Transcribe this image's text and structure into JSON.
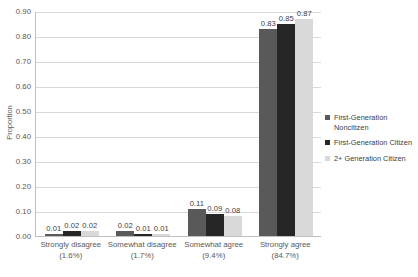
{
  "chart_data": {
    "type": "bar",
    "title": "",
    "subtitle": "",
    "xlabel": "",
    "ylabel": "Proportion",
    "ylim": [
      0.0,
      0.9
    ],
    "ytick_labels": [
      "0.90",
      "0.80",
      "0.70",
      "0.60",
      "0.50",
      "0.40",
      "0.30",
      "0.20",
      "0.10",
      "0.00"
    ],
    "ytick_values": [
      0.9,
      0.8,
      0.7,
      0.6,
      0.5,
      0.4,
      0.3,
      0.2,
      0.1,
      0.0
    ],
    "grid": true,
    "legend_position": "right",
    "categories": [
      "Strongly disagree",
      "Somewhat disagree",
      "Somewhat agree",
      "Strongly agree"
    ],
    "category_percents": [
      "(1.6%)",
      "(1.7%)",
      "(9.4%)",
      "(84.7%)"
    ],
    "series": [
      {
        "name": "First-Generation Noncitizen",
        "color": "#595959",
        "values": [
          0.01,
          0.02,
          0.11,
          0.83
        ],
        "labels": [
          "0.01",
          "0.02",
          "0.11",
          "0.83"
        ]
      },
      {
        "name": "First-Generation Citizen",
        "color": "#262626",
        "values": [
          0.02,
          0.01,
          0.09,
          0.85
        ],
        "labels": [
          "0.02",
          "0.01",
          "0.09",
          "0.85"
        ]
      },
      {
        "name": "2+ Generation Citizen",
        "color": "#d9d9d9",
        "values": [
          0.02,
          0.01,
          0.08,
          0.87
        ],
        "labels": [
          "0.02",
          "0.01",
          "0.08",
          "0.87"
        ]
      }
    ]
  },
  "legend": {
    "items": [
      {
        "label": "First-Generation Noncitizen",
        "color": "#595959"
      },
      {
        "label": "First-Generation Citizen",
        "color": "#262626"
      },
      {
        "label": "2+ Generation Citizen",
        "color": "#d9d9d9"
      }
    ]
  }
}
